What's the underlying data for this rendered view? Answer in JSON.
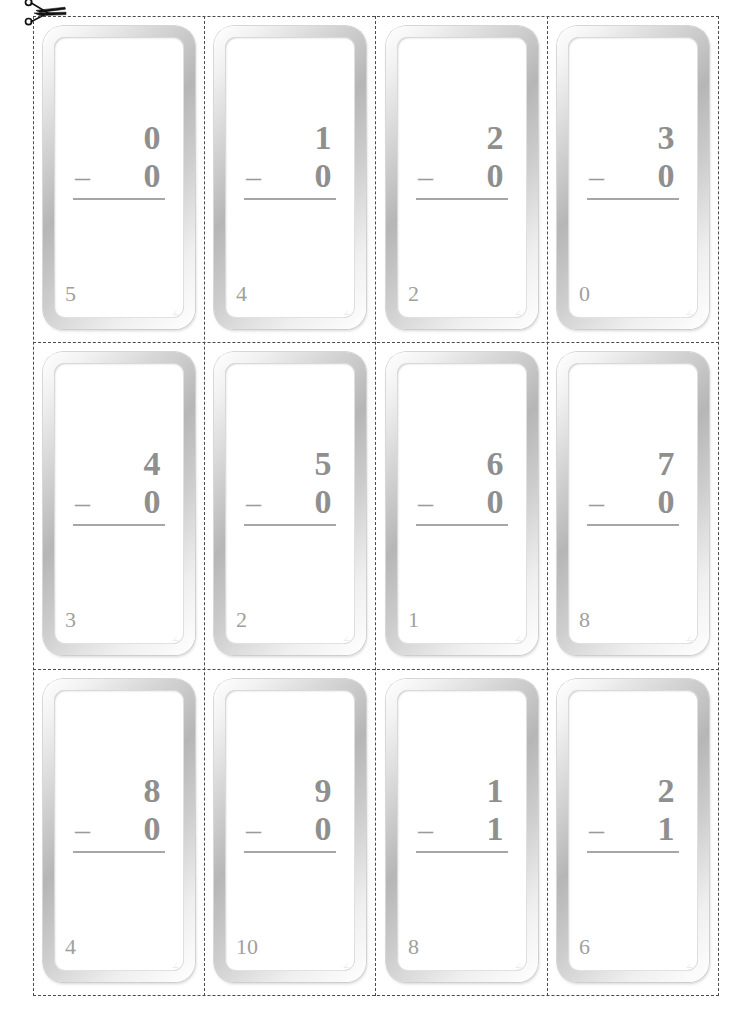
{
  "page": {
    "background_color": "#ffffff",
    "digit_color": "#8f8f8f",
    "answer_color": "#a0a0a0",
    "cut_line_color": "#4a4a4a",
    "card_frame_color": "#b6b6b6"
  },
  "tools": {
    "scissors_icon": "scissors-icon",
    "cut_here_hint": ""
  },
  "layout": {
    "rows": 3,
    "columns": 4,
    "card_count": 12
  },
  "cards": [
    {
      "minuend": "0",
      "operator": "–",
      "subtrahend": "0",
      "answer": "5",
      "row": 1,
      "col": 1
    },
    {
      "minuend": "1",
      "operator": "–",
      "subtrahend": "0",
      "answer": "4",
      "row": 1,
      "col": 2
    },
    {
      "minuend": "2",
      "operator": "–",
      "subtrahend": "0",
      "answer": "2",
      "row": 1,
      "col": 3
    },
    {
      "minuend": "3",
      "operator": "–",
      "subtrahend": "0",
      "answer": "0",
      "row": 1,
      "col": 4
    },
    {
      "minuend": "4",
      "operator": "–",
      "subtrahend": "0",
      "answer": "3",
      "row": 2,
      "col": 1
    },
    {
      "minuend": "5",
      "operator": "–",
      "subtrahend": "0",
      "answer": "2",
      "row": 2,
      "col": 2
    },
    {
      "minuend": "6",
      "operator": "–",
      "subtrahend": "0",
      "answer": "1",
      "row": 2,
      "col": 3
    },
    {
      "minuend": "7",
      "operator": "–",
      "subtrahend": "0",
      "answer": "8",
      "row": 2,
      "col": 4
    },
    {
      "minuend": "8",
      "operator": "–",
      "subtrahend": "0",
      "answer": "4",
      "row": 3,
      "col": 1
    },
    {
      "minuend": "9",
      "operator": "–",
      "subtrahend": "0",
      "answer": "10",
      "row": 3,
      "col": 2
    },
    {
      "minuend": "1",
      "operator": "–",
      "subtrahend": "1",
      "answer": "8",
      "row": 3,
      "col": 3
    },
    {
      "minuend": "2",
      "operator": "–",
      "subtrahend": "1",
      "answer": "6",
      "row": 3,
      "col": 4
    }
  ]
}
